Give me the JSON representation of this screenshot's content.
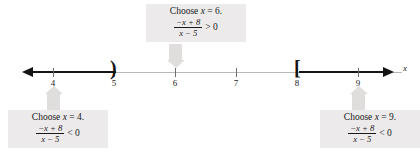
{
  "figure": {
    "type": "number-line-sign-chart",
    "axis_label": "x",
    "ticks": [
      {
        "value": "4",
        "x": 53
      },
      {
        "value": "5",
        "x": 114
      },
      {
        "value": "6",
        "x": 175
      },
      {
        "value": "7",
        "x": 236
      },
      {
        "value": "8",
        "x": 297
      },
      {
        "value": "9",
        "x": 358
      }
    ],
    "brackets": [
      {
        "glyph": ")",
        "at": "5",
        "meaning": "open-endpoint"
      },
      {
        "glyph": "[",
        "at": "8",
        "meaning": "closed-endpoint"
      }
    ],
    "shaded_intervals": [
      {
        "from": "-infinity",
        "to": "5",
        "included": false
      },
      {
        "from": "8",
        "to": "+infinity",
        "included": true
      }
    ]
  },
  "callouts": {
    "top": {
      "line1_prefix": "Choose ",
      "line1_var": "x",
      "line1_suffix": " = 6.",
      "numerator": "−x + 8",
      "denominator": "x − 5",
      "relation": "> 0"
    },
    "left": {
      "line1_prefix": "Choose ",
      "line1_var": "x",
      "line1_suffix": " = 4.",
      "numerator": "−x + 8",
      "denominator": "x − 5",
      "relation": "< 0"
    },
    "right": {
      "line1_prefix": "Choose ",
      "line1_var": "x",
      "line1_suffix": " = 9.",
      "numerator": "−x + 8",
      "denominator": "x − 5",
      "relation": "< 0"
    }
  },
  "colors": {
    "callout_background": "#eceaea",
    "connector": "#e0dedd",
    "bold_axis": "#141414",
    "thin_axis": "#b9b9b9",
    "text": "#1a1a1a"
  }
}
